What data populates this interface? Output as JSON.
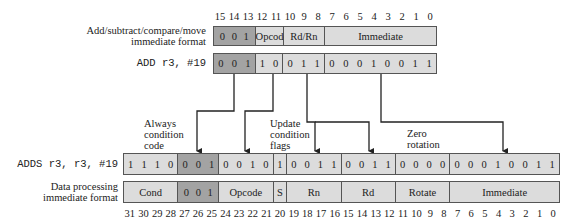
{
  "top": {
    "format_label_1": "Add/subtract/compare/move",
    "format_label_2": "immediate format",
    "instr_label": "ADD r3, #19",
    "bit_numbers": [
      "15",
      "14",
      "13",
      "12",
      "11",
      "10",
      "9",
      "8",
      "7",
      "6",
      "5",
      "4",
      "3",
      "2",
      "1",
      "0"
    ],
    "format_fields": [
      {
        "label": "0 0 1",
        "bits": 3,
        "dark": true
      },
      {
        "label": "Opcode",
        "bits": 2,
        "dark": false
      },
      {
        "label": "Rd/Rn",
        "bits": 3,
        "dark": false
      },
      {
        "label": "Immediate",
        "bits": 8,
        "dark": false
      }
    ],
    "instr_fields": [
      {
        "bits": [
          "0",
          "0",
          "1"
        ],
        "dark": true
      },
      {
        "bits": [
          "1",
          "0"
        ],
        "dark": false
      },
      {
        "bits": [
          "0",
          "1",
          "1"
        ],
        "dark": false
      },
      {
        "bits": [
          "0",
          "0",
          "0",
          "1",
          "0",
          "0",
          "1",
          "1"
        ],
        "dark": false
      }
    ]
  },
  "bottom": {
    "instr_label": "ADDS r3, r3, #19",
    "format_label_1": "Data processing",
    "format_label_2": "immediate format",
    "bit_numbers": [
      "31",
      "30",
      "29",
      "28",
      "27",
      "26",
      "25",
      "24",
      "23",
      "22",
      "21",
      "20",
      "19",
      "18",
      "17",
      "16",
      "15",
      "14",
      "13",
      "12",
      "11",
      "10",
      "9",
      "8",
      "7",
      "6",
      "5",
      "4",
      "3",
      "2",
      "1",
      "0"
    ],
    "instr_fields": [
      {
        "bits": [
          "1",
          "1",
          "1",
          "0"
        ],
        "dark": false
      },
      {
        "bits": [
          "0",
          "0",
          "1"
        ],
        "dark": true
      },
      {
        "bits": [
          "0",
          "0",
          "1",
          "0"
        ],
        "dark": false
      },
      {
        "bits": [
          "1"
        ],
        "dark": false
      },
      {
        "bits": [
          "0",
          "0",
          "1",
          "1"
        ],
        "dark": false
      },
      {
        "bits": [
          "0",
          "0",
          "1",
          "1"
        ],
        "dark": false
      },
      {
        "bits": [
          "0",
          "0",
          "0",
          "0"
        ],
        "dark": false
      },
      {
        "bits": [
          "0",
          "0",
          "0",
          "1",
          "0",
          "0",
          "1",
          "1"
        ],
        "dark": false
      }
    ],
    "format_fields": [
      {
        "label": "Cond",
        "bits": 4,
        "dark": false
      },
      {
        "label": "0 0 1",
        "bits": 3,
        "dark": true
      },
      {
        "label": "Opcode",
        "bits": 4,
        "dark": false
      },
      {
        "label": "S",
        "bits": 1,
        "dark": false
      },
      {
        "label": "Rn",
        "bits": 4,
        "dark": false
      },
      {
        "label": "Rd",
        "bits": 4,
        "dark": false
      },
      {
        "label": "Rotate",
        "bits": 4,
        "dark": false
      },
      {
        "label": "Immediate",
        "bits": 8,
        "dark": false
      }
    ]
  },
  "annotations": {
    "always_1": "Always",
    "always_2": "condition",
    "always_3": "code",
    "update_1": "Update",
    "update_2": "condition",
    "update_3": "flags",
    "zero_1": "Zero",
    "zero_2": "rotation"
  }
}
